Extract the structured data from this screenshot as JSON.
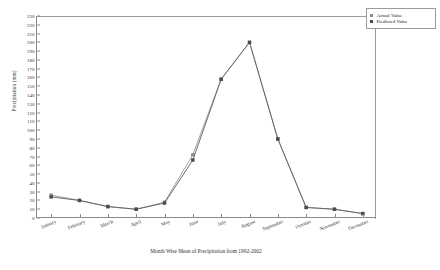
{
  "chart_data": {
    "type": "line",
    "title": "",
    "xlabel": "Month Wise Mean of Precipitation from 1992-2002",
    "ylabel": "Precipitation (mm)",
    "categories": [
      "January",
      "February",
      "March",
      "April",
      "May",
      "June",
      "July",
      "August",
      "September",
      "October",
      "November",
      "December"
    ],
    "ylim": [
      0,
      230
    ],
    "yticks": [
      0,
      10,
      20,
      30,
      40,
      50,
      60,
      70,
      80,
      90,
      100,
      110,
      120,
      130,
      140,
      150,
      160,
      170,
      180,
      190,
      200,
      210,
      220,
      230
    ],
    "grid": false,
    "legend_position": "top-right",
    "series": [
      {
        "name": "Actual Value",
        "color": "#9a9a9a",
        "marker": "square",
        "values": [
          26,
          20,
          13,
          10,
          18,
          72,
          158,
          200,
          90,
          12,
          10,
          5
        ]
      },
      {
        "name": "Predicted Value",
        "color": "#5e5e5e",
        "marker": "square",
        "values": [
          24,
          20,
          13,
          10,
          17,
          66,
          158,
          200,
          90,
          12,
          10,
          5
        ]
      }
    ]
  },
  "legend": {
    "items": [
      {
        "label": "Actual Value"
      },
      {
        "label": "Predicted Value"
      }
    ]
  },
  "axes": {
    "y_title": "Precipitation (mm)",
    "x_title": "Month Wise Mean of Precipitation from 1992-2002"
  }
}
